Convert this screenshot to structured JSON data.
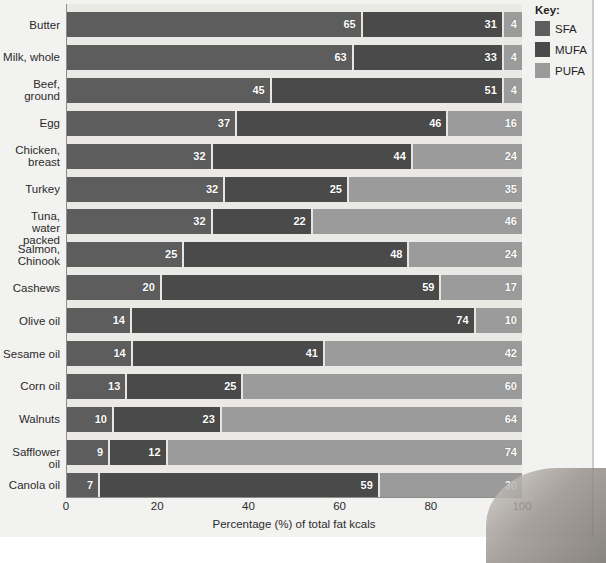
{
  "legend": {
    "title": "Key:",
    "items": [
      {
        "label": "SFA",
        "color": "#5d5d5d"
      },
      {
        "label": "MUFA",
        "color": "#4a4a4a"
      },
      {
        "label": "PUFA",
        "color": "#9b9b9b"
      }
    ]
  },
  "axis": {
    "xlabel": "Percentage (%) of total fat kcals",
    "xticks": [
      "0",
      "20",
      "40",
      "60",
      "80",
      "100"
    ]
  },
  "chart_data": {
    "type": "bar",
    "orientation": "horizontal",
    "stacked": true,
    "title": "",
    "xlabel": "Percentage (%) of total fat kcals",
    "ylabel": "",
    "xlim": [
      0,
      100
    ],
    "xticks": [
      0,
      20,
      40,
      60,
      80,
      100
    ],
    "grid": false,
    "legend_position": "right",
    "legend_title": "Key:",
    "categories": [
      "Butter",
      "Milk, whole",
      "Beef,\nground",
      "Egg",
      "Chicken,\nbreast",
      "Turkey",
      "Tuna, water\npacked",
      "Salmon,\nChinook",
      "Cashews",
      "Olive oil",
      "Sesame oil",
      "Corn oil",
      "Walnuts",
      "Safflower oil",
      "Canola oil"
    ],
    "series": [
      {
        "name": "SFA",
        "color": "#5d5d5d",
        "values": [
          65,
          63,
          45,
          37,
          32,
          32,
          32,
          25,
          20,
          14,
          14,
          13,
          10,
          9,
          7
        ]
      },
      {
        "name": "MUFA",
        "color": "#4a4a4a",
        "values": [
          31,
          33,
          51,
          46,
          44,
          25,
          22,
          48,
          59,
          74,
          41,
          25,
          23,
          12,
          59
        ]
      },
      {
        "name": "PUFA",
        "color": "#9b9b9b",
        "values": [
          4,
          4,
          4,
          16,
          24,
          35,
          46,
          24,
          17,
          10,
          42,
          60,
          64,
          74,
          30
        ]
      }
    ]
  }
}
